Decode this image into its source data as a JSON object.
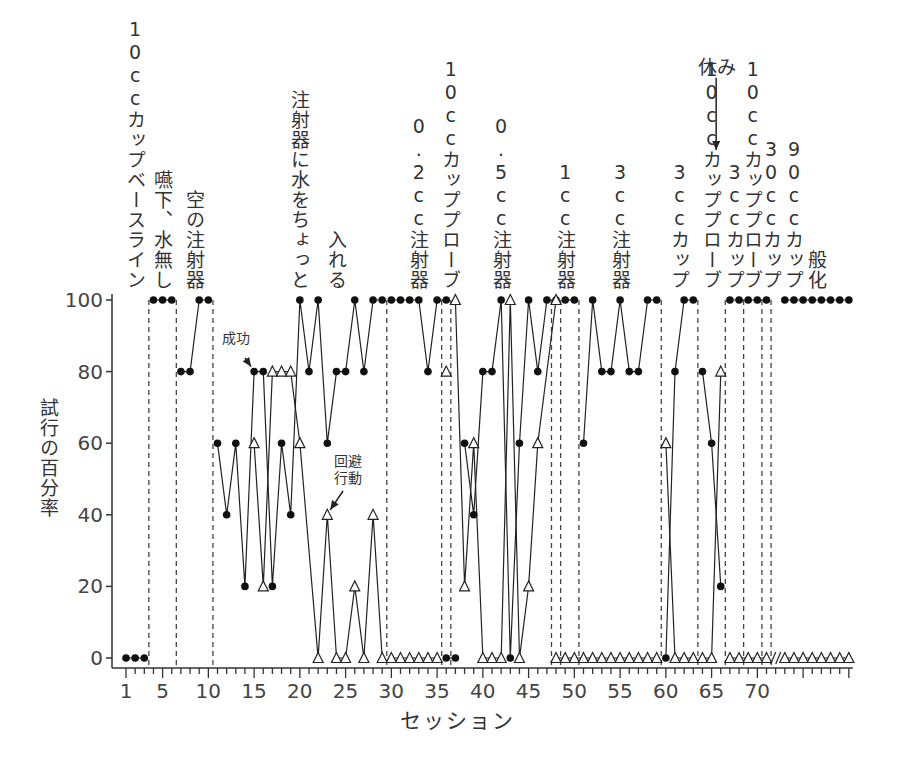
{
  "chart_data": {
    "type": "line",
    "title": "",
    "xlabel": "セッション",
    "ylabel": "試行の百分率",
    "ylim": [
      0,
      100
    ],
    "xlim": [
      1,
      80
    ],
    "yticks": [
      "0",
      "20",
      "40",
      "60",
      "80",
      "100"
    ],
    "xticks": [
      "1",
      "5",
      "10",
      "15",
      "20",
      "25",
      "30",
      "35",
      "40",
      "45",
      "50",
      "55",
      "60",
      "65",
      "70"
    ],
    "grid": false,
    "legend": "none",
    "series": [
      {
        "name": "success",
        "marker": "filled-circle",
        "segments": [
          [
            [
              1,
              0
            ],
            [
              2,
              0
            ],
            [
              3,
              0
            ]
          ],
          [
            [
              4,
              100
            ],
            [
              5,
              100
            ],
            [
              6,
              100
            ]
          ],
          [
            [
              7,
              80
            ],
            [
              8,
              80
            ],
            [
              9,
              100
            ],
            [
              10,
              100
            ]
          ],
          [
            [
              11,
              60
            ],
            [
              12,
              40
            ],
            [
              13,
              60
            ],
            [
              14,
              20
            ],
            [
              15,
              80
            ],
            [
              16,
              80
            ],
            [
              17,
              20
            ],
            [
              18,
              60
            ],
            [
              19,
              40
            ],
            [
              20,
              100
            ],
            [
              21,
              80
            ],
            [
              22,
              100
            ],
            [
              23,
              60
            ],
            [
              24,
              80
            ],
            [
              25,
              80
            ],
            [
              26,
              100
            ],
            [
              27,
              80
            ],
            [
              28,
              100
            ],
            [
              29,
              100
            ]
          ],
          [
            [
              30,
              100
            ],
            [
              31,
              100
            ],
            [
              32,
              100
            ],
            [
              33,
              100
            ],
            [
              34,
              80
            ],
            [
              35,
              100
            ],
            [
              36,
              100
            ]
          ],
          [
            [
              36,
              0
            ],
            [
              37,
              0
            ]
          ],
          [
            [
              38,
              60
            ],
            [
              39,
              40
            ],
            [
              40,
              80
            ],
            [
              41,
              80
            ],
            [
              42,
              100
            ],
            [
              43,
              0
            ],
            [
              44,
              60
            ],
            [
              45,
              100
            ],
            [
              46,
              80
            ],
            [
              47,
              100
            ],
            [
              48,
              100
            ]
          ],
          [
            [
              49,
              100
            ],
            [
              50,
              100
            ]
          ],
          [
            [
              51,
              60
            ],
            [
              52,
              100
            ],
            [
              53,
              80
            ],
            [
              54,
              80
            ],
            [
              55,
              100
            ],
            [
              56,
              80
            ],
            [
              57,
              80
            ],
            [
              58,
              100
            ],
            [
              59,
              100
            ]
          ],
          [
            [
              60,
              0
            ],
            [
              61,
              80
            ],
            [
              62,
              100
            ],
            [
              63,
              100
            ]
          ],
          [
            [
              64,
              80
            ],
            [
              65,
              60
            ],
            [
              66,
              20
            ]
          ],
          [
            [
              67,
              100
            ],
            [
              68,
              100
            ],
            [
              69,
              100
            ],
            [
              70,
              100
            ],
            [
              71,
              100
            ]
          ],
          [
            [
              73,
              100
            ],
            [
              74,
              100
            ],
            [
              75,
              100
            ],
            [
              76,
              100
            ],
            [
              77,
              100
            ],
            [
              78,
              100
            ],
            [
              79,
              100
            ],
            [
              80,
              100
            ]
          ]
        ]
      },
      {
        "name": "avoidance",
        "marker": "open-triangle",
        "segments": [
          [
            [
              15,
              60
            ],
            [
              16,
              20
            ],
            [
              17,
              80
            ],
            [
              18,
              80
            ],
            [
              19,
              80
            ],
            [
              20,
              60
            ],
            [
              22,
              0
            ],
            [
              23,
              40
            ],
            [
              24,
              0
            ],
            [
              25,
              0
            ],
            [
              26,
              20
            ],
            [
              27,
              0
            ],
            [
              28,
              40
            ],
            [
              29,
              0
            ]
          ],
          [
            [
              30,
              0
            ],
            [
              31,
              0
            ],
            [
              32,
              0
            ],
            [
              33,
              0
            ],
            [
              34,
              0
            ],
            [
              35,
              0
            ]
          ],
          [
            [
              36,
              80
            ]
          ],
          [
            [
              37,
              100
            ],
            [
              38,
              20
            ],
            [
              39,
              60
            ],
            [
              40,
              0
            ],
            [
              41,
              0
            ],
            [
              42,
              0
            ],
            [
              43,
              100
            ],
            [
              44,
              0
            ],
            [
              45,
              20
            ],
            [
              46,
              60
            ],
            [
              48,
              100
            ]
          ],
          [
            [
              48,
              0
            ],
            [
              49,
              0
            ],
            [
              50,
              0
            ],
            [
              51,
              0
            ],
            [
              52,
              0
            ],
            [
              53,
              0
            ],
            [
              54,
              0
            ],
            [
              55,
              0
            ],
            [
              56,
              0
            ],
            [
              57,
              0
            ],
            [
              58,
              0
            ],
            [
              59,
              0
            ]
          ],
          [
            [
              60,
              60
            ],
            [
              61,
              0
            ],
            [
              62,
              0
            ],
            [
              63,
              0
            ]
          ],
          [
            [
              64,
              0
            ],
            [
              65,
              0
            ],
            [
              66,
              80
            ]
          ],
          [
            [
              67,
              0
            ],
            [
              68,
              0
            ],
            [
              69,
              0
            ],
            [
              70,
              0
            ],
            [
              71,
              0
            ]
          ],
          [
            [
              73,
              0
            ],
            [
              74,
              0
            ],
            [
              75,
              0
            ],
            [
              76,
              0
            ],
            [
              77,
              0
            ],
            [
              78,
              0
            ],
            [
              79,
              0
            ],
            [
              80,
              0
            ]
          ]
        ]
      }
    ],
    "phase_boundaries": [
      3.5,
      6.5,
      10.5,
      29.5,
      35.5,
      36.5,
      47.5,
      48.5,
      50.5,
      59.5,
      63.5,
      66.5,
      68.5,
      70.5,
      71.5
    ],
    "axis_break_after": 71,
    "phases": [
      {
        "label": "10ccカップベースライン",
        "session": 2
      },
      {
        "label": "嚥下、水無し",
        "session": 5
      },
      {
        "label": "空の注射器",
        "session": 8.5
      },
      {
        "label": "注射器に水をちょっと",
        "session": 20
      },
      {
        "label": "入れる",
        "session": 24
      },
      {
        "label": "0.2cc注射器",
        "session": 33
      },
      {
        "label": "10ccカッププローブ",
        "session": 36.5
      },
      {
        "label": "0.5cc注射器",
        "session": 42
      },
      {
        "label": "1cc注射器",
        "session": 49
      },
      {
        "label": "3cc注射器",
        "session": 55
      },
      {
        "label": "3ccカップ",
        "session": 61.5
      },
      {
        "label": "10ccカッププローブ",
        "session": 65
      },
      {
        "label": "3ccカップ",
        "session": 67.5
      },
      {
        "label": "10ccカッププローブ",
        "session": 69.5
      },
      {
        "label": "30ccカップ",
        "session": 71.5
      },
      {
        "label": "90ccカップ",
        "session": 74
      },
      {
        "label": "般化",
        "session": 76.5
      }
    ],
    "annotations": [
      {
        "text": "成功",
        "points_to": [
          15,
          80
        ]
      },
      {
        "text": "回避行動",
        "points_to": [
          23,
          40
        ]
      },
      {
        "text": "休み",
        "points_to_session": 65.5
      }
    ]
  }
}
